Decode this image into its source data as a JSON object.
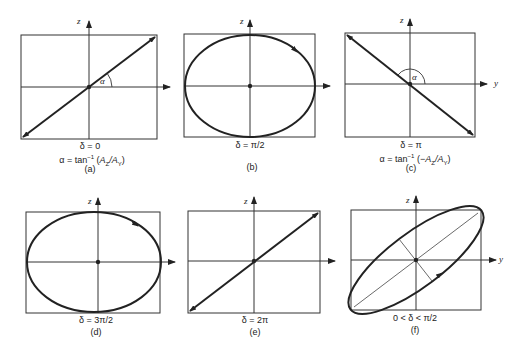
{
  "figure": {
    "axis_labels": {
      "z": "z",
      "y": "y"
    },
    "panels": [
      {
        "id": "a",
        "label": "(a)",
        "condition": "δ = 0",
        "alpha_expr_prefix": "α = tan",
        "alpha_expr_sup": "−1",
        "alpha_expr_arg": "(A_Z / A_Y)",
        "alpha_arg_a": "A",
        "alpha_arg_asub": "Z",
        "alpha_arg_b": "/A",
        "alpha_arg_bsub": "Y",
        "alpha_open": "(",
        "alpha_close": ")",
        "angle_label": "α",
        "curve": "line-positive-slope"
      },
      {
        "id": "b",
        "label": "(b)",
        "condition": "δ = π/2",
        "curve": "ellipse-clockwise"
      },
      {
        "id": "c",
        "label": "(c)",
        "condition": "δ = π",
        "alpha_expr_prefix": "α = tan",
        "alpha_expr_sup": "−1",
        "alpha_open": "(−",
        "alpha_arg_a": "A",
        "alpha_arg_asub": "Z",
        "alpha_arg_b": "/A",
        "alpha_arg_bsub": "Y",
        "alpha_close": ")",
        "angle_label": "α",
        "curve": "line-negative-slope"
      },
      {
        "id": "d",
        "label": "(d)",
        "condition": "δ = 3π/2",
        "curve": "ellipse-clockwise"
      },
      {
        "id": "e",
        "label": "(e)",
        "condition": "δ = 2π",
        "curve": "line-positive-slope"
      },
      {
        "id": "f",
        "label": "(f)",
        "condition": "0 < δ < π/2",
        "curve": "tilted-ellipse"
      }
    ]
  }
}
